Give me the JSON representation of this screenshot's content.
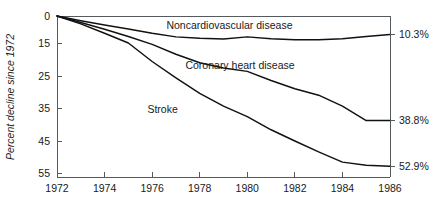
{
  "chart_data": {
    "type": "line",
    "title": "",
    "xlabel": "",
    "ylabel": "Percent decline since 1972",
    "grid": false,
    "legend_position": "inline-annotations",
    "x": [
      1972,
      1973,
      1974,
      1975,
      1976,
      1977,
      1978,
      1979,
      1980,
      1981,
      1982,
      1983,
      1984,
      1985,
      1986
    ],
    "xlim": [
      1972,
      1986
    ],
    "ylim": [
      0,
      55
    ],
    "y_inverted": true,
    "xticks": [
      "1972",
      "1974",
      "1976",
      "1978",
      "1980",
      "1982",
      "1984",
      "1986"
    ],
    "xtick_values": [
      1972,
      1974,
      1976,
      1978,
      1980,
      1982,
      1984,
      1986
    ],
    "yticks": [
      "0",
      "15",
      "25",
      "35",
      "45",
      "55"
    ],
    "ytick_values": [
      0,
      15,
      25,
      35,
      45,
      55
    ],
    "series": [
      {
        "name": "Noncardiovascular disease",
        "label": "Noncardiovascular disease",
        "end_label": "10.3%",
        "end_value": 10.3,
        "values": [
          0,
          2.6,
          5.0,
          7.2,
          9.6,
          11.6,
          12.4,
          12.8,
          11.6,
          12.6,
          13.2,
          13.2,
          12.6,
          11.4,
          10.3
        ]
      },
      {
        "name": "Coronary heart disease",
        "label": "Coronary heart disease",
        "end_label": "38.8%",
        "end_value": 38.8,
        "values": [
          0,
          3.6,
          7.4,
          11.4,
          15.4,
          18.4,
          21.0,
          22.6,
          23.6,
          26.4,
          29.0,
          31.0,
          34.4,
          38.8,
          38.8
        ]
      },
      {
        "name": "Stroke",
        "label": "Stroke",
        "end_label": "52.9%",
        "end_value": 52.9,
        "values": [
          0,
          4.4,
          9.6,
          15.0,
          20.6,
          25.6,
          30.4,
          34.4,
          37.6,
          41.6,
          45.0,
          48.4,
          51.6,
          52.6,
          52.9
        ]
      }
    ],
    "annotations": [
      {
        "text": "Noncardiovascular disease",
        "x": 1976.6,
        "y": 7.0
      },
      {
        "text": "Coronary heart disease",
        "x": 1977.4,
        "y": 23.0
      },
      {
        "text": "Stroke",
        "x": 1975.8,
        "y": 36.5
      }
    ],
    "colors": {
      "line": "#111111",
      "axis": "#555a5e",
      "text": "#1a1a1a",
      "background": "#ffffff"
    }
  }
}
